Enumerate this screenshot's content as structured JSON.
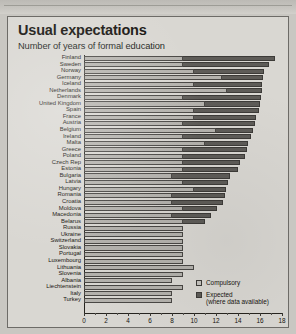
{
  "chart_data": {
    "type": "bar",
    "orientation": "horizontal",
    "title": "Usual expectations",
    "subtitle": "Number of years of formal education",
    "xlabel": "",
    "ylabel": "",
    "xlim": [
      0,
      18
    ],
    "xticks": [
      0,
      2,
      4,
      6,
      8,
      10,
      12,
      14,
      16,
      18
    ],
    "xtick_labels": [
      "0",
      "2",
      "4",
      "6",
      "8",
      "10",
      "12",
      "14",
      "16",
      "18"
    ],
    "grid": false,
    "legend_position": "bottom-right",
    "legend": [
      {
        "key": "compulsory",
        "label": "Compulsory",
        "sublabel": "",
        "color": "#c6c4bf"
      },
      {
        "key": "expected",
        "label": "Expected",
        "sublabel": "(where data available)",
        "color": "#5e5c58"
      }
    ],
    "categories": [
      "Finland",
      "Sweden",
      "Norway",
      "Germany",
      "Iceland",
      "Netherlands",
      "Denmark",
      "United Kingdom",
      "Spain",
      "France",
      "Austria",
      "Belgium",
      "Ireland",
      "Malta",
      "Greece",
      "Poland",
      "Czech Rep",
      "Estonia",
      "Bulgaria",
      "Latvia",
      "Hungary",
      "Romania",
      "Croatia",
      "Moldova",
      "Macedonia",
      "Belarus",
      "Russia",
      "Ukraine",
      "Switzerland",
      "Slovakia",
      "Portugal",
      "Luxembourg",
      "Lithuania",
      "Slovenia",
      "Albania",
      "Liechtenstein",
      "Italy",
      "Turkey"
    ],
    "series": [
      {
        "name": "Compulsory",
        "color": "#c6c4bf",
        "values": [
          9.0,
          9.0,
          10.0,
          12.5,
          10.0,
          13.0,
          9.0,
          11.0,
          10.0,
          10.0,
          9.0,
          12.0,
          9.0,
          11.0,
          9.0,
          9.0,
          9.0,
          9.0,
          8.0,
          9.0,
          10.0,
          8.0,
          8.0,
          9.0,
          8.0,
          9.0,
          9.0,
          9.0,
          9.0,
          9.0,
          9.0,
          9.0,
          10.0,
          9.0,
          8.0,
          9.0,
          8.0,
          8.0
        ]
      },
      {
        "name": "Expected",
        "color": "#5e5c58",
        "values": [
          17.4,
          16.8,
          16.4,
          16.3,
          16.2,
          16.2,
          16.1,
          16.0,
          15.9,
          15.6,
          15.5,
          15.4,
          15.2,
          14.9,
          14.8,
          14.6,
          14.2,
          14.0,
          13.3,
          13.1,
          12.9,
          12.8,
          12.6,
          12.1,
          11.5,
          11.0,
          null,
          null,
          null,
          null,
          null,
          null,
          null,
          null,
          null,
          null,
          null,
          null
        ]
      }
    ]
  }
}
